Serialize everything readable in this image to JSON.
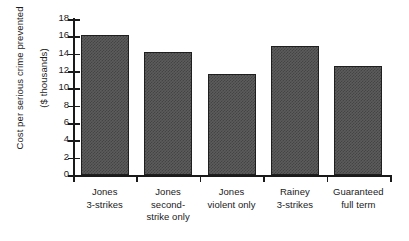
{
  "chart_data": {
    "type": "bar",
    "title": "",
    "subtitle": "",
    "xlabel": "",
    "ylabel": "Cost per serious crime prevented ($ thousands)",
    "ylabel_lines": [
      "Cost per serious crime prevented",
      "($ thousands)"
    ],
    "categories": [
      "Jones 3-strikes",
      "Jones second-strike only",
      "Jones violent only",
      "Rainey 3-strikes",
      "Guaranteed full term"
    ],
    "category_label_lines": [
      [
        "Jones",
        "3-strikes"
      ],
      [
        "Jones",
        "second-",
        "strike only"
      ],
      [
        "Jones",
        "violent only"
      ],
      [
        "Rainey",
        "3-strikes"
      ],
      [
        "Guaranteed",
        "full term"
      ]
    ],
    "values": [
      16.2,
      14.2,
      11.6,
      14.9,
      12.6
    ],
    "ylim": [
      0,
      18
    ],
    "ytick_step": 2,
    "yticks": [
      0,
      2,
      4,
      6,
      8,
      10,
      12,
      14,
      16,
      18
    ],
    "ytick_labels": [
      "0",
      "2",
      "4",
      "6",
      "8",
      "10",
      "12",
      "14",
      "16",
      "18"
    ],
    "grid": false,
    "legend": null,
    "legend_position": "none",
    "bar_color": "#5c5c5c",
    "bar_edge_color": "#1f1f1f",
    "axis_color": "#1a1a1a",
    "background_color": "#ffffff"
  }
}
